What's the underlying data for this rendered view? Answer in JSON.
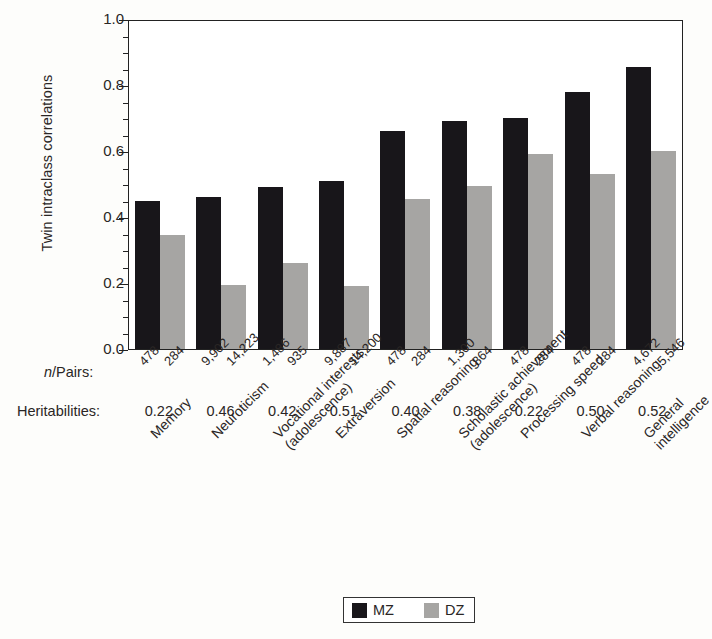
{
  "chart_data": {
    "type": "bar",
    "title": "",
    "xlabel": "",
    "ylabel": "Twin intraclass correlations",
    "ylim": [
      0,
      1.0
    ],
    "ytick_labels": [
      "1.0",
      "0.8",
      "0.6",
      "0.4",
      "0.2",
      "0.0"
    ],
    "ytick_values": [
      1.0,
      0.8,
      0.6,
      0.4,
      0.2,
      0.0
    ],
    "minor_tick_step": 0.05,
    "grid": false,
    "legend_position": "bottom-center",
    "categories": [
      "Memory",
      "Neuroticism",
      "Vocational interests (adolescence)",
      "Extraversion",
      "Spatial reasoning",
      "Scholastic achievement (adolescence)",
      "Processing speed",
      "Verbal reasoning",
      "General intelligence"
    ],
    "category_lines": [
      [
        "Memory",
        ""
      ],
      [
        "Neuroticism",
        ""
      ],
      [
        "Vocational interests",
        "(adolescence)"
      ],
      [
        "Extraversion",
        ""
      ],
      [
        "Spatial reasoning",
        ""
      ],
      [
        "Scholastic achievement",
        "(adolescence)"
      ],
      [
        "Processing speed",
        ""
      ],
      [
        "Verbal reasoning",
        ""
      ],
      [
        "General",
        "intelligence"
      ]
    ],
    "series": [
      {
        "name": "MZ",
        "color": "#18161a",
        "values": [
          0.45,
          0.46,
          0.49,
          0.51,
          0.66,
          0.69,
          0.7,
          0.78,
          0.855
        ]
      },
      {
        "name": "DZ",
        "color": "#a6a5a3",
        "values": [
          0.345,
          0.195,
          0.26,
          0.19,
          0.455,
          0.495,
          0.59,
          0.53,
          0.6
        ]
      }
    ],
    "n_pairs": {
      "label": "n/Pairs:",
      "mz": [
        "478",
        "9,902",
        "1,486",
        "9,887",
        "478",
        "1,300",
        "478",
        "478",
        "4,672"
      ],
      "dz": [
        "284",
        "14,223",
        "935",
        "14,200",
        "284",
        "864",
        "284",
        "284",
        "5,546"
      ]
    },
    "heritabilities": {
      "label": "Heritabilities:",
      "values": [
        "0.22",
        "0.46",
        "0.42",
        "0.51",
        "0.40",
        "0.38",
        "0.22",
        "0.50",
        "0.52"
      ]
    },
    "legend": [
      {
        "name": "MZ",
        "color": "#18161a"
      },
      {
        "name": "DZ",
        "color": "#a6a5a3"
      }
    ]
  }
}
